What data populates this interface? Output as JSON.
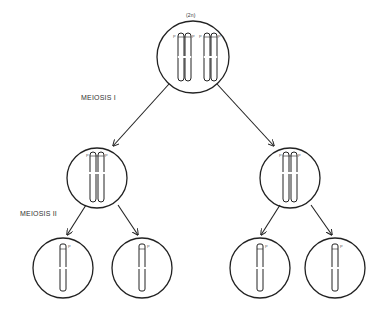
{
  "title_label": "(2n)",
  "stages": {
    "meiosis1": "MEIOSIS I",
    "meiosis2": "MEIOSIS II"
  },
  "marker_label": "P",
  "colors": {
    "stroke": "#222222",
    "text": "#333333",
    "background": "#ffffff"
  },
  "cells": [
    {
      "id": "parent",
      "label": "(2n)",
      "chromosome_pairs": 2,
      "chromatids_per_chromosome": 2
    },
    {
      "id": "meiosis1-left",
      "chromosome_pairs": 1,
      "chromatids_per_chromosome": 2
    },
    {
      "id": "meiosis1-right",
      "chromosome_pairs": 1,
      "chromatids_per_chromosome": 2
    },
    {
      "id": "meiosis2-1",
      "chromatids": 1
    },
    {
      "id": "meiosis2-2",
      "chromatids": 1
    },
    {
      "id": "meiosis2-3",
      "chromatids": 1
    },
    {
      "id": "meiosis2-4",
      "chromatids": 1
    }
  ]
}
